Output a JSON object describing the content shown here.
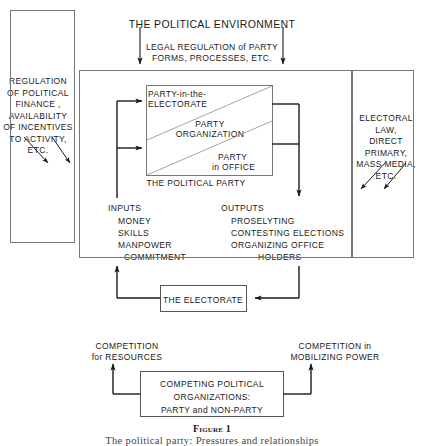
{
  "figure": {
    "title_top": "THE  POLITICAL  ENVIRONMENT",
    "caption_label": "Figure 1",
    "caption_text": "The political party: Pressures and relationships",
    "accent_color": "#1a1a1a",
    "border_color": "#555555"
  },
  "top_flow": {
    "legal_regulation_line1": "LEGAL  REGULATION  of  PARTY",
    "legal_regulation_line2": "FORMS,  PROCESSES,  ETC.",
    "arrow_left_name": "legal-regulation-arrow-left",
    "arrow_right_name": "legal-regulation-arrow-right"
  },
  "left_panel": {
    "lines": [
      "REGULATION",
      "OF POLITICAL",
      "FINANCE ,",
      "AVAILABILITY",
      "OF INCENTIVES",
      "TO ACTIVITY,",
      "ETC."
    ]
  },
  "right_panel": {
    "lines": [
      "ELECTORAL LAW,",
      "DIRECT PRIMARY,",
      "MASS MEDIA,",
      "ETC."
    ]
  },
  "party_box": {
    "segments": [
      {
        "id": "party-in-electorate",
        "line1": "PARTY-in-the-",
        "line2": "ELECTORATE"
      },
      {
        "id": "party-organization",
        "line1": "PARTY",
        "line2": "ORGANIZATION"
      },
      {
        "id": "party-in-office",
        "line1": "PARTY",
        "line2": "in OFFICE"
      }
    ],
    "caption": "THE  POLITICAL  PARTY"
  },
  "inputs": {
    "heading": "INPUTS",
    "items": [
      "MONEY",
      "SKILLS",
      "MANPOWER",
      "COMMITMENT"
    ]
  },
  "outputs": {
    "heading": "OUTPUTS",
    "items": [
      "PROSELYTING",
      "CONTESTING ELECTIONS",
      "ORGANIZING OFFICE",
      "HOLDERS"
    ]
  },
  "electorate_box": {
    "label": "THE  ELECTORATE"
  },
  "competition": {
    "left_line1": "COMPETITION",
    "left_line2": "for RESOURCES",
    "right_line1": "COMPETITION in",
    "right_line2": "MOBILIZING POWER"
  },
  "competing_box": {
    "line1": "COMPETING  POLITICAL",
    "line2": "ORGANIZATIONS:",
    "line3": "PARTY and NON-PARTY"
  }
}
